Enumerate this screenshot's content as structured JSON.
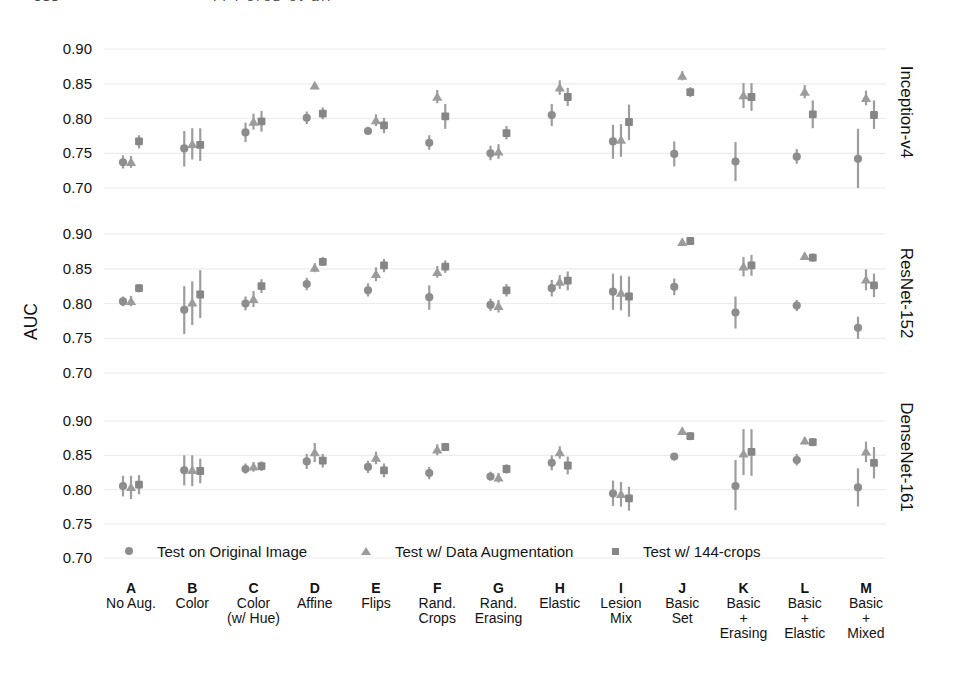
{
  "page_header": {
    "page_number": "388",
    "running_title": "F. Perez et al."
  },
  "axis": {
    "ylabel": "AUC",
    "ytick_labels": [
      "0.90",
      "0.85",
      "0.80",
      "0.75",
      "0.70"
    ]
  },
  "colors": {
    "circle": "#8d8d8d",
    "triangle": "#9c9c9c",
    "square": "#868686",
    "errorbar": "#9d9d9d",
    "gridline": "#ececec",
    "text": "#141414"
  },
  "legend": {
    "items": [
      {
        "marker": "circle",
        "label": "Test on Original Image"
      },
      {
        "marker": "triangle",
        "label": "Test w/ Data Augmentation"
      },
      {
        "marker": "square",
        "label": "Test w/ 144-crops"
      }
    ]
  },
  "chart_data": {
    "type": "scatter",
    "subtype": "pointplot-with-error-bars",
    "ylabel": "AUC",
    "yticks": [
      0.9,
      0.85,
      0.8,
      0.75,
      0.7
    ],
    "ylim": [
      0.68,
      0.92
    ],
    "grid": true,
    "legend_position": "inside-bottom-panel",
    "row_labels": [
      "Inception-v4",
      "ResNet-152",
      "DenseNet-161"
    ],
    "categories": [
      {
        "key": "A",
        "name_lines": [
          "No Aug."
        ]
      },
      {
        "key": "B",
        "name_lines": [
          "Color"
        ]
      },
      {
        "key": "C",
        "name_lines": [
          "Color",
          "(w/ Hue)"
        ]
      },
      {
        "key": "D",
        "name_lines": [
          "Affine"
        ]
      },
      {
        "key": "E",
        "name_lines": [
          "Flips"
        ]
      },
      {
        "key": "F",
        "name_lines": [
          "Rand.",
          "Crops"
        ]
      },
      {
        "key": "G",
        "name_lines": [
          "Rand.",
          "Erasing"
        ]
      },
      {
        "key": "H",
        "name_lines": [
          "Elastic"
        ]
      },
      {
        "key": "I",
        "name_lines": [
          "Lesion",
          "Mix"
        ]
      },
      {
        "key": "J",
        "name_lines": [
          "Basic",
          "Set"
        ]
      },
      {
        "key": "K",
        "name_lines": [
          "Basic",
          "+",
          "Erasing"
        ]
      },
      {
        "key": "L",
        "name_lines": [
          "Basic",
          "+",
          "Elastic"
        ]
      },
      {
        "key": "M",
        "name_lines": [
          "Basic",
          "+",
          "Mixed"
        ]
      }
    ],
    "point_format": "[auc, ci_low, ci_high]",
    "panels": [
      {
        "model": "Inception-v4",
        "series": [
          {
            "name": "Test on Original Image",
            "marker": "circle",
            "points": [
              [
                0.737,
                0.728,
                0.747
              ],
              [
                0.757,
                0.731,
                0.782
              ],
              [
                0.78,
                0.766,
                0.794
              ],
              [
                0.801,
                0.792,
                0.81
              ],
              [
                0.782,
                0.777,
                0.788
              ],
              [
                0.765,
                0.755,
                0.776
              ],
              [
                0.75,
                0.74,
                0.761
              ],
              [
                0.805,
                0.789,
                0.821
              ],
              [
                0.767,
                0.742,
                0.791
              ],
              [
                0.749,
                0.731,
                0.767
              ],
              [
                0.738,
                0.71,
                0.766
              ],
              [
                0.745,
                0.735,
                0.756
              ],
              [
                0.742,
                0.7,
                0.785
              ]
            ]
          },
          {
            "name": "Test w/ Data Augmentation",
            "marker": "triangle",
            "points": [
              [
                0.737,
                0.729,
                0.746
              ],
              [
                0.763,
                0.741,
                0.786
              ],
              [
                0.795,
                0.784,
                0.807
              ],
              [
                0.847,
                0.842,
                0.852
              ],
              [
                0.797,
                0.789,
                0.806
              ],
              [
                0.831,
                0.822,
                0.841
              ],
              [
                0.752,
                0.742,
                0.763
              ],
              [
                0.844,
                0.834,
                0.855
              ],
              [
                0.769,
                0.745,
                0.792
              ],
              [
                0.861,
                0.855,
                0.868
              ],
              [
                0.833,
                0.815,
                0.851
              ],
              [
                0.838,
                0.829,
                0.848
              ],
              [
                0.829,
                0.819,
                0.84
              ]
            ]
          },
          {
            "name": "Test w/ 144-crops",
            "marker": "square",
            "points": [
              [
                0.767,
                0.757,
                0.776
              ],
              [
                0.762,
                0.739,
                0.786
              ],
              [
                0.796,
                0.781,
                0.811
              ],
              [
                0.807,
                0.799,
                0.816
              ],
              [
                0.79,
                0.779,
                0.801
              ],
              [
                0.803,
                0.785,
                0.821
              ],
              [
                0.779,
                0.77,
                0.789
              ],
              [
                0.831,
                0.818,
                0.844
              ],
              [
                0.795,
                0.769,
                0.82
              ],
              [
                0.838,
                0.831,
                0.845
              ],
              [
                0.831,
                0.811,
                0.851
              ],
              [
                0.806,
                0.786,
                0.826
              ],
              [
                0.805,
                0.785,
                0.826
              ]
            ]
          }
        ]
      },
      {
        "model": "ResNet-152",
        "series": [
          {
            "name": "Test on Original Image",
            "marker": "circle",
            "points": [
              [
                0.803,
                0.796,
                0.81
              ],
              [
                0.791,
                0.756,
                0.825
              ],
              [
                0.8,
                0.79,
                0.81
              ],
              [
                0.828,
                0.819,
                0.837
              ],
              [
                0.819,
                0.81,
                0.829
              ],
              [
                0.809,
                0.791,
                0.826
              ],
              [
                0.798,
                0.789,
                0.807
              ],
              [
                0.822,
                0.81,
                0.834
              ],
              [
                0.817,
                0.791,
                0.843
              ],
              [
                0.824,
                0.812,
                0.836
              ],
              [
                0.787,
                0.764,
                0.81
              ],
              [
                0.797,
                0.789,
                0.805
              ],
              [
                0.765,
                0.749,
                0.781
              ]
            ]
          },
          {
            "name": "Test w/ Data Augmentation",
            "marker": "triangle",
            "points": [
              [
                0.803,
                0.796,
                0.811
              ],
              [
                0.801,
                0.769,
                0.832
              ],
              [
                0.806,
                0.795,
                0.818
              ],
              [
                0.851,
                0.845,
                0.858
              ],
              [
                0.842,
                0.832,
                0.852
              ],
              [
                0.845,
                0.837,
                0.854
              ],
              [
                0.796,
                0.787,
                0.805
              ],
              [
                0.831,
                0.821,
                0.841
              ],
              [
                0.815,
                0.79,
                0.84
              ],
              [
                0.888,
                0.884,
                0.892
              ],
              [
                0.853,
                0.839,
                0.867
              ],
              [
                0.868,
                0.863,
                0.873
              ],
              [
                0.834,
                0.819,
                0.849
              ]
            ]
          },
          {
            "name": "Test w/ 144-crops",
            "marker": "square",
            "points": [
              [
                0.822,
                0.816,
                0.828
              ],
              [
                0.813,
                0.779,
                0.848
              ],
              [
                0.825,
                0.815,
                0.835
              ],
              [
                0.86,
                0.854,
                0.867
              ],
              [
                0.855,
                0.845,
                0.864
              ],
              [
                0.853,
                0.844,
                0.862
              ],
              [
                0.819,
                0.81,
                0.828
              ],
              [
                0.833,
                0.819,
                0.846
              ],
              [
                0.81,
                0.781,
                0.839
              ],
              [
                0.89,
                0.886,
                0.894
              ],
              [
                0.855,
                0.84,
                0.87
              ],
              [
                0.866,
                0.86,
                0.872
              ],
              [
                0.826,
                0.809,
                0.843
              ]
            ]
          }
        ]
      },
      {
        "model": "DenseNet-161",
        "series": [
          {
            "name": "Test on Original Image",
            "marker": "circle",
            "points": [
              [
                0.805,
                0.79,
                0.82
              ],
              [
                0.828,
                0.806,
                0.85
              ],
              [
                0.83,
                0.823,
                0.838
              ],
              [
                0.841,
                0.83,
                0.852
              ],
              [
                0.833,
                0.824,
                0.842
              ],
              [
                0.824,
                0.815,
                0.833
              ],
              [
                0.819,
                0.813,
                0.826
              ],
              [
                0.839,
                0.828,
                0.85
              ],
              [
                0.794,
                0.776,
                0.813
              ],
              [
                0.848,
                0.843,
                0.853
              ],
              [
                0.805,
                0.77,
                0.843
              ],
              [
                0.843,
                0.835,
                0.852
              ],
              [
                0.803,
                0.775,
                0.831
              ]
            ]
          },
          {
            "name": "Test w/ Data Augmentation",
            "marker": "triangle",
            "points": [
              [
                0.803,
                0.786,
                0.82
              ],
              [
                0.828,
                0.805,
                0.85
              ],
              [
                0.833,
                0.826,
                0.84
              ],
              [
                0.854,
                0.84,
                0.868
              ],
              [
                0.846,
                0.837,
                0.855
              ],
              [
                0.858,
                0.85,
                0.866
              ],
              [
                0.817,
                0.81,
                0.824
              ],
              [
                0.854,
                0.845,
                0.863
              ],
              [
                0.793,
                0.775,
                0.811
              ],
              [
                0.885,
                0.88,
                0.89
              ],
              [
                0.852,
                0.821,
                0.888
              ],
              [
                0.871,
                0.866,
                0.876
              ],
              [
                0.855,
                0.84,
                0.87
              ]
            ]
          },
          {
            "name": "Test w/ 144-crops",
            "marker": "square",
            "points": [
              [
                0.807,
                0.793,
                0.821
              ],
              [
                0.827,
                0.809,
                0.845
              ],
              [
                0.834,
                0.827,
                0.841
              ],
              [
                0.842,
                0.832,
                0.852
              ],
              [
                0.828,
                0.818,
                0.838
              ],
              [
                0.862,
                0.858,
                0.867
              ],
              [
                0.83,
                0.823,
                0.837
              ],
              [
                0.835,
                0.822,
                0.848
              ],
              [
                0.787,
                0.769,
                0.804
              ],
              [
                0.878,
                0.872,
                0.884
              ],
              [
                0.855,
                0.82,
                0.888
              ],
              [
                0.869,
                0.863,
                0.875
              ],
              [
                0.839,
                0.816,
                0.862
              ]
            ]
          }
        ]
      }
    ]
  }
}
